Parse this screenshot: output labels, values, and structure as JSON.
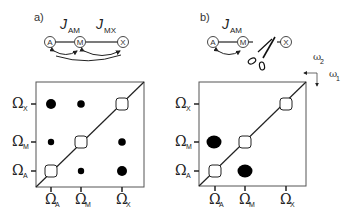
{
  "panels": [
    {
      "label": "a)",
      "couplings": [
        {
          "symbol": "J",
          "sub": "AM"
        },
        {
          "symbol": "J",
          "sub": "MX"
        }
      ],
      "nodes": [
        "A",
        "M",
        "X"
      ],
      "y_axis": [
        {
          "sym": "Ω",
          "sub": "X"
        },
        {
          "sym": "Ω",
          "sub": "M"
        },
        {
          "sym": "Ω",
          "sub": "A"
        }
      ],
      "x_axis": [
        {
          "sym": "Ω",
          "sub": "A"
        },
        {
          "sym": "Ω",
          "sub": "M"
        },
        {
          "sym": "Ω",
          "sub": "X"
        }
      ]
    },
    {
      "label": "b)",
      "couplings": [
        {
          "symbol": "J",
          "sub": "AM"
        }
      ],
      "nodes": [
        "A",
        "M",
        "X"
      ],
      "y_axis": [
        {
          "sym": "Ω",
          "sub": "X"
        },
        {
          "sym": "Ω",
          "sub": "M"
        },
        {
          "sym": "Ω",
          "sub": "A"
        }
      ],
      "x_axis": [
        {
          "sym": "Ω",
          "sub": "A"
        },
        {
          "sym": "Ω",
          "sub": "M"
        },
        {
          "sym": "Ω",
          "sub": "X"
        }
      ]
    }
  ],
  "axes_legend": {
    "w2": "ω",
    "w2_sub": "2",
    "w1": "ω",
    "w1_sub": "1"
  },
  "colors": {
    "line": "#222222",
    "peak": "#000000",
    "diag_peak_fill": "#ffffff"
  }
}
